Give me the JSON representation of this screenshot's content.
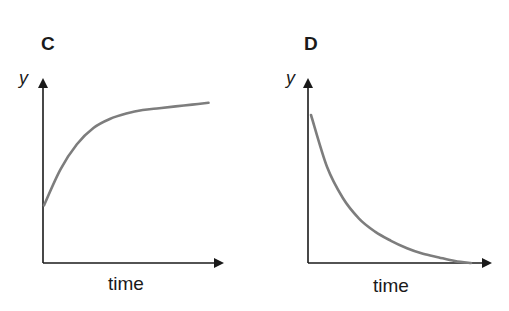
{
  "colors": {
    "axis": "#1a1a1a",
    "curve": "#7d7d7d",
    "text": "#1a1a1a",
    "background": "#ffffff"
  },
  "chart_data": [
    {
      "type": "line",
      "title": "C",
      "xlabel": "time",
      "ylabel": "y",
      "grid": false,
      "ticks": "none",
      "description": "Increasing curve starting from a non-zero y-intercept, rising steeply then levelling off toward a plateau (saturating growth).",
      "series": [
        {
          "name": "y",
          "x": [
            0,
            0.1,
            0.2,
            0.3,
            0.4,
            0.5,
            0.6,
            0.7,
            0.8,
            0.9,
            1.0
          ],
          "values": [
            0.32,
            0.52,
            0.66,
            0.75,
            0.8,
            0.83,
            0.85,
            0.86,
            0.87,
            0.88,
            0.89
          ]
        }
      ],
      "xlim": [
        0,
        1.1
      ],
      "ylim": [
        0,
        1
      ]
    },
    {
      "type": "line",
      "title": "D",
      "xlabel": "time",
      "ylabel": "y",
      "grid": false,
      "ticks": "none",
      "description": "Decreasing curve starting high near the y-axis, falling steeply then gradually approaching zero (exponential decay).",
      "series": [
        {
          "name": "y",
          "x": [
            0,
            0.1,
            0.2,
            0.3,
            0.4,
            0.5,
            0.6,
            0.7,
            0.8,
            0.9,
            1.0
          ],
          "values": [
            0.8,
            0.52,
            0.35,
            0.24,
            0.17,
            0.12,
            0.08,
            0.05,
            0.03,
            0.01,
            0.0
          ]
        }
      ],
      "xlim": [
        0,
        1.1
      ],
      "ylim": [
        0,
        1
      ]
    }
  ],
  "panels": {
    "c": {
      "label": "C",
      "y_label": "y",
      "x_label": "time"
    },
    "d": {
      "label": "D",
      "y_label": "y",
      "x_label": "time"
    }
  }
}
